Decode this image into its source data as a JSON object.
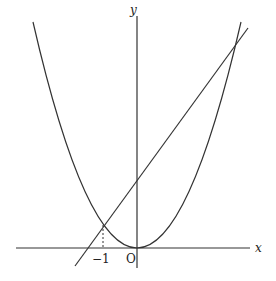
{
  "diagram": {
    "type": "function-graph",
    "curves": [
      {
        "name": "parabola",
        "description": "upward parabola with vertex at origin"
      },
      {
        "name": "line",
        "description": "line with positive slope intersecting the parabola at x = -1 and at a second point to the upper right"
      }
    ],
    "axes": {
      "x_label": "x",
      "y_label": "y",
      "origin_label": "O"
    },
    "tick_labels": [
      {
        "value": -1,
        "label": "−1"
      }
    ],
    "annotations": [
      {
        "type": "dashed-guide",
        "from": "intersection at x=-1",
        "to": "x-axis"
      }
    ],
    "colors": {
      "stroke": "#333333",
      "background": "#ffffff"
    }
  }
}
